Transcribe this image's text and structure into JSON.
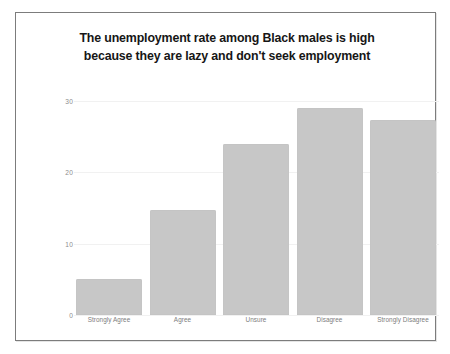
{
  "chart_data": {
    "type": "bar",
    "title": "The unemployment rate among Black males is high because they are lazy and don't seek employment",
    "title_lines": [
      "The unemployment rate among Black males is high",
      "because they are lazy and don't seek employment"
    ],
    "categories": [
      "Strongly Agree",
      "Agree",
      "Unsure",
      "Disagree",
      "Strongly Disagree"
    ],
    "values": [
      5,
      14.7,
      24,
      29,
      27.3
    ],
    "xlabel": "",
    "ylabel": "",
    "ylim": [
      0,
      30
    ],
    "yticks": [
      0,
      10,
      20,
      30
    ],
    "ytick_labels": [
      "0",
      "10",
      "20",
      "30"
    ],
    "grid": true,
    "legend": false,
    "bar_color": "#c7c7c7",
    "title_color": "#161616",
    "tick_color": "#8d8d8d",
    "background": "#ffffff",
    "border_color": "#7c7c7c"
  }
}
